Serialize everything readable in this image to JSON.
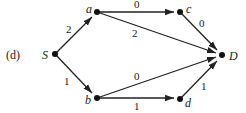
{
  "figure_label": "(d)",
  "nodes": [
    {
      "id": "S",
      "label": "S",
      "x": 55,
      "y": 54
    },
    {
      "id": "a",
      "label": "a",
      "x": 97,
      "y": 12
    },
    {
      "id": "b",
      "label": "b",
      "x": 97,
      "y": 98
    },
    {
      "id": "c",
      "label": "c",
      "x": 180,
      "y": 12
    },
    {
      "id": "D",
      "label": "D",
      "x": 222,
      "y": 55
    },
    {
      "id": "d",
      "label": "d",
      "x": 180,
      "y": 99
    }
  ],
  "edges": [
    {
      "from": "S",
      "to": "a",
      "weight": "2"
    },
    {
      "from": "S",
      "to": "b",
      "weight": "1"
    },
    {
      "from": "a",
      "to": "c",
      "weight": "0"
    },
    {
      "from": "a",
      "to": "D",
      "weight": "2"
    },
    {
      "from": "c",
      "to": "D",
      "weight": "0"
    },
    {
      "from": "b",
      "to": "D",
      "weight": "0"
    },
    {
      "from": "b",
      "to": "d",
      "weight": "1"
    },
    {
      "from": "d",
      "to": "D",
      "weight": "1"
    }
  ],
  "colors": {
    "ink": "#222222",
    "background": "#ffffff"
  }
}
